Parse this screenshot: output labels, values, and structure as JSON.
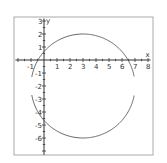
{
  "chart_data": {
    "type": "line",
    "title": "",
    "xlabel": "x",
    "ylabel": "y",
    "xlim": [
      -2.2,
      8.2
    ],
    "ylim": [
      -7.3,
      3.2
    ],
    "x_ticks": [
      -1,
      1,
      2,
      3,
      4,
      5,
      6,
      7,
      8
    ],
    "y_ticks": [
      3,
      2,
      1,
      -1,
      -2,
      -3,
      -4,
      -5,
      -6
    ],
    "grid": false,
    "legend": null,
    "series": [
      {
        "name": "circle (x-3)^2 + (y+2)^2 = 16, upper arc",
        "shape": "arc",
        "center": [
          3,
          -2
        ],
        "radius": 4,
        "y_from": -1.3,
        "part": "upper"
      },
      {
        "name": "circle (x-3)^2 + (y+2)^2 = 16, lower arc",
        "shape": "arc",
        "center": [
          3,
          -2
        ],
        "radius": 4,
        "y_to": -2.7,
        "part": "lower"
      }
    ],
    "colors": {
      "frame": "#aaaaaa",
      "axis": "#333333",
      "curve": "#555555"
    }
  }
}
